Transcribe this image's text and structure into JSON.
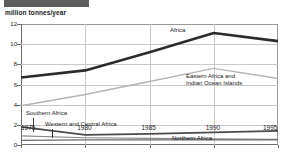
{
  "banner": {
    "text": ""
  },
  "axis_caption": "million tonnes/year",
  "annotations": {
    "africa": "Africa",
    "eastern_l1": "Eastern Africa and",
    "eastern_l2": "Indian Ocean Islands",
    "southern": "Southern Africa",
    "western_central": "Western and Central Africa",
    "northern": "Northern Africa"
  },
  "chart_data": {
    "type": "line",
    "title": "",
    "xlabel": "",
    "ylabel": "million tonnes/year",
    "x": [
      1975,
      1980,
      1985,
      1990,
      1995
    ],
    "xtick_labels": [
      "1975",
      "1980",
      "1985",
      "1990",
      "1995"
    ],
    "ytick_labels": [
      "0",
      "2",
      "4",
      "6",
      "8",
      "10",
      "12"
    ],
    "yticks": [
      0,
      2,
      4,
      6,
      8,
      10,
      12
    ],
    "xlim": [
      1975,
      1995
    ],
    "ylim": [
      0,
      12
    ],
    "grid": "both",
    "legend": "inline-labels",
    "series": [
      {
        "name": "Africa",
        "values": [
          6.7,
          7.4,
          9.2,
          11.1,
          10.3
        ],
        "color": "#2b2b2b",
        "width": 2.6
      },
      {
        "name": "Eastern Africa and Indian Ocean Islands",
        "values": [
          3.9,
          5.0,
          6.3,
          7.6,
          6.6
        ],
        "color": "#b4b4b4",
        "width": 1.5
      },
      {
        "name": "Western and Central Africa",
        "values": [
          1.8,
          1.0,
          1.1,
          1.25,
          1.4
        ],
        "color": "#4a4a4a",
        "width": 1.8
      },
      {
        "name": "Southern Africa",
        "values": [
          0.9,
          0.72,
          0.66,
          0.6,
          0.55
        ],
        "color": "#8a8a8a",
        "width": 1.2
      },
      {
        "name": "Northern Africa",
        "values": [
          0.45,
          0.5,
          0.5,
          0.5,
          0.5
        ],
        "color": "#6b6b6b",
        "width": 1.2
      }
    ]
  }
}
